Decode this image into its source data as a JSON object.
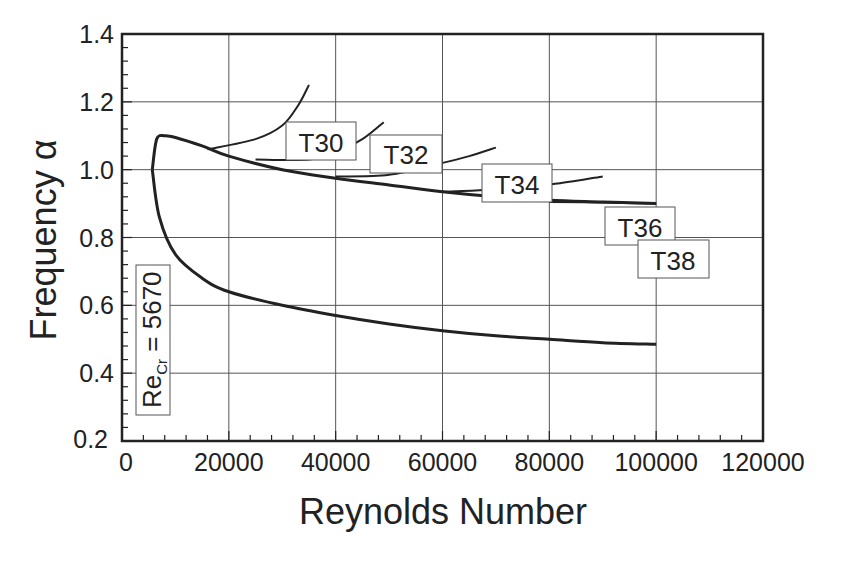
{
  "chart_data": {
    "type": "line",
    "title": "",
    "xlabel": "Reynolds Number",
    "ylabel": "Frequency α",
    "xlim": [
      0,
      120000
    ],
    "ylim": [
      0.2,
      1.4
    ],
    "grid": true,
    "legend": "none (curves labeled by inline boxes)",
    "x_ticks": [
      "0",
      "20000",
      "40000",
      "60000",
      "80000",
      "100000",
      "120000"
    ],
    "y_ticks": [
      "0.2",
      "0.4",
      "0.6",
      "0.8",
      "1.0",
      "1.2",
      "1.4"
    ],
    "series": [
      {
        "name": "Neutral curve (upper branch)",
        "x": [
          5670,
          6500,
          8000,
          10000,
          15000,
          20000,
          30000,
          40000,
          50000,
          60000,
          70000,
          80000,
          90000,
          100000
        ],
        "y": [
          1.0,
          1.09,
          1.1,
          1.095,
          1.07,
          1.04,
          1.0,
          0.975,
          0.955,
          0.935,
          0.92,
          0.91,
          0.905,
          0.9
        ]
      },
      {
        "name": "Neutral curve (lower branch)",
        "x": [
          5670,
          7000,
          10000,
          15000,
          20000,
          30000,
          40000,
          50000,
          60000,
          70000,
          80000,
          90000,
          100000
        ],
        "y": [
          1.0,
          0.86,
          0.75,
          0.68,
          0.64,
          0.6,
          0.57,
          0.545,
          0.525,
          0.51,
          0.5,
          0.49,
          0.485
        ]
      },
      {
        "name": "T30",
        "x": [
          16000,
          25000,
          30000,
          33000,
          35000
        ],
        "y": [
          1.06,
          1.09,
          1.13,
          1.19,
          1.25
        ]
      },
      {
        "name": "T32",
        "x": [
          25000,
          35000,
          40000,
          45000,
          49000
        ],
        "y": [
          1.03,
          1.03,
          1.05,
          1.09,
          1.14
        ]
      },
      {
        "name": "T34",
        "x": [
          40000,
          50000,
          60000,
          65000,
          70000
        ],
        "y": [
          0.98,
          0.985,
          1.02,
          1.04,
          1.065
        ]
      },
      {
        "name": "T36",
        "x": [
          60000,
          68000,
          75000,
          82000,
          90000
        ],
        "y": [
          0.935,
          0.94,
          0.95,
          0.96,
          0.98
        ]
      },
      {
        "name": "T38",
        "x": [
          80000,
          90000,
          100000
        ],
        "y": [
          0.905,
          0.903,
          0.9
        ]
      }
    ],
    "annotations": [
      {
        "text": "T30",
        "x": 30000,
        "y": 1.085
      },
      {
        "text": "T32",
        "x": 53000,
        "y": 1.05
      },
      {
        "text": "T34",
        "x": 72000,
        "y": 0.955
      },
      {
        "text": "T36",
        "x": 92000,
        "y": 0.83
      },
      {
        "text": "T38",
        "x": 103000,
        "y": 0.735
      },
      {
        "text": "Re_Cr = 5670",
        "x": 6000,
        "y": 0.47,
        "rotation": -90
      }
    ]
  },
  "labels": {
    "xlabel": "Reynolds Number",
    "ylabel": "Frequency α",
    "recr_main": "Re",
    "recr_sub": "Cr",
    "recr_value": " = 5670",
    "boxes": [
      "T30",
      "T32",
      "T34",
      "T36",
      "T38"
    ]
  },
  "colors": {
    "line": "#222222",
    "grid": "#555555",
    "background": "#ffffff"
  }
}
